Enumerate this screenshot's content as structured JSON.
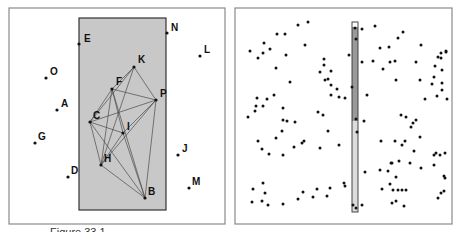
{
  "figure": {
    "caption": "Figure 33.1",
    "left_panel": {
      "frame": {
        "x": 9,
        "y": 8,
        "w": 216,
        "h": 216
      },
      "region": {
        "x": 79,
        "y": 18,
        "w": 87,
        "h": 192,
        "fill": "#c8c8c8"
      },
      "points": [
        {
          "label": "E",
          "x": 79,
          "y": 44,
          "lx": 84,
          "ly": 42
        },
        {
          "label": "N",
          "x": 167,
          "y": 33,
          "lx": 171,
          "ly": 31
        },
        {
          "label": "L",
          "x": 200,
          "y": 56,
          "lx": 204,
          "ly": 53
        },
        {
          "label": "K",
          "x": 134,
          "y": 67,
          "lx": 138,
          "ly": 63
        },
        {
          "label": "O",
          "x": 46,
          "y": 78,
          "lx": 50,
          "ly": 75
        },
        {
          "label": "F",
          "x": 112,
          "y": 89,
          "lx": 116,
          "ly": 85
        },
        {
          "label": "P",
          "x": 156,
          "y": 100,
          "lx": 160,
          "ly": 97
        },
        {
          "label": "A",
          "x": 57,
          "y": 110,
          "lx": 61,
          "ly": 107
        },
        {
          "label": "C",
          "x": 90,
          "y": 122,
          "lx": 93,
          "ly": 119
        },
        {
          "label": "I",
          "x": 123,
          "y": 133,
          "lx": 127,
          "ly": 130
        },
        {
          "label": "G",
          "x": 35,
          "y": 143,
          "lx": 38,
          "ly": 140
        },
        {
          "label": "J",
          "x": 178,
          "y": 155,
          "lx": 182,
          "ly": 152
        },
        {
          "label": "H",
          "x": 101,
          "y": 165,
          "lx": 104,
          "ly": 162
        },
        {
          "label": "D",
          "x": 68,
          "y": 177,
          "lx": 71,
          "ly": 174
        },
        {
          "label": "M",
          "x": 189,
          "y": 188,
          "lx": 192,
          "ly": 185
        },
        {
          "label": "B",
          "x": 145,
          "y": 198,
          "lx": 148,
          "ly": 195
        }
      ],
      "edges": [
        [
          "K",
          "F"
        ],
        [
          "K",
          "C"
        ],
        [
          "K",
          "P"
        ],
        [
          "K",
          "H"
        ],
        [
          "F",
          "P"
        ],
        [
          "F",
          "C"
        ],
        [
          "F",
          "I"
        ],
        [
          "F",
          "H"
        ],
        [
          "F",
          "B"
        ],
        [
          "C",
          "P"
        ],
        [
          "C",
          "I"
        ],
        [
          "C",
          "H"
        ],
        [
          "C",
          "B"
        ],
        [
          "P",
          "I"
        ],
        [
          "P",
          "H"
        ],
        [
          "P",
          "B"
        ],
        [
          "I",
          "H"
        ],
        [
          "I",
          "B"
        ],
        [
          "H",
          "B"
        ]
      ]
    },
    "right_panel": {
      "frame": {
        "x": 235,
        "y": 8,
        "w": 217,
        "h": 216
      },
      "bar": {
        "x": 352,
        "y": 22,
        "w": 6,
        "h": 190,
        "split_y": 121,
        "dark_fill": "#9a9a9a",
        "light_fill": "#dcdcdc"
      },
      "points": [
        [
          250,
          51
        ],
        [
          258,
          58
        ],
        [
          263,
          53
        ],
        [
          264,
          43
        ],
        [
          277,
          34
        ],
        [
          270,
          49
        ],
        [
          285,
          34
        ],
        [
          286,
          55
        ],
        [
          276,
          68
        ],
        [
          298,
          25
        ],
        [
          290,
          82
        ],
        [
          308,
          22
        ],
        [
          305,
          45
        ],
        [
          320,
          72
        ],
        [
          324,
          59
        ],
        [
          324,
          65
        ],
        [
          328,
          79
        ],
        [
          325,
          80
        ],
        [
          331,
          71
        ],
        [
          331,
          85
        ],
        [
          337,
          89
        ],
        [
          331,
          95
        ],
        [
          349,
          55
        ],
        [
          355,
          28
        ],
        [
          356,
          39
        ],
        [
          356,
          119
        ],
        [
          257,
          98
        ],
        [
          256,
          106
        ],
        [
          274,
          95
        ],
        [
          267,
          99
        ],
        [
          283,
          108
        ],
        [
          339,
          97
        ],
        [
          352,
          87
        ],
        [
          345,
          98
        ],
        [
          248,
          117
        ],
        [
          255,
          111
        ],
        [
          263,
          106
        ],
        [
          283,
          120
        ],
        [
          287,
          121
        ],
        [
          258,
          141
        ],
        [
          262,
          149
        ],
        [
          276,
          138
        ],
        [
          282,
          131
        ],
        [
          283,
          155
        ],
        [
          269,
          154
        ],
        [
          294,
          147
        ],
        [
          328,
          131
        ],
        [
          304,
          141
        ],
        [
          323,
          115
        ],
        [
          302,
          143
        ],
        [
          318,
          112
        ],
        [
          339,
          145
        ],
        [
          295,
          122
        ],
        [
          320,
          148
        ],
        [
          357,
          132
        ],
        [
          253,
          189
        ],
        [
          263,
          183
        ],
        [
          265,
          193
        ],
        [
          262,
          201
        ],
        [
          252,
          202
        ],
        [
          268,
          205
        ],
        [
          283,
          204
        ],
        [
          298,
          199
        ],
        [
          303,
          192
        ],
        [
          313,
          197
        ],
        [
          327,
          196
        ],
        [
          330,
          188
        ],
        [
          317,
          189
        ],
        [
          344,
          183
        ],
        [
          345,
          186
        ],
        [
          353,
          205
        ],
        [
          356,
          208
        ],
        [
          362,
          29
        ],
        [
          375,
          26
        ],
        [
          398,
          38
        ],
        [
          403,
          32
        ],
        [
          421,
          45
        ],
        [
          438,
          57
        ],
        [
          446,
          52
        ],
        [
          441,
          53
        ],
        [
          446,
          51
        ],
        [
          441,
          58
        ],
        [
          442,
          70
        ],
        [
          435,
          66
        ],
        [
          416,
          62
        ],
        [
          390,
          62
        ],
        [
          389,
          47
        ],
        [
          395,
          61
        ],
        [
          362,
          62
        ],
        [
          380,
          48
        ],
        [
          373,
          61
        ],
        [
          383,
          69
        ],
        [
          396,
          80
        ],
        [
          420,
          80
        ],
        [
          434,
          77
        ],
        [
          432,
          84
        ],
        [
          442,
          83
        ],
        [
          442,
          90
        ],
        [
          425,
          99
        ],
        [
          437,
          96
        ],
        [
          447,
          99
        ],
        [
          367,
          95
        ],
        [
          364,
          121
        ],
        [
          401,
          115
        ],
        [
          406,
          117
        ],
        [
          413,
          123
        ],
        [
          411,
          127
        ],
        [
          416,
          120
        ],
        [
          420,
          137
        ],
        [
          405,
          141
        ],
        [
          381,
          141
        ],
        [
          395,
          141
        ],
        [
          402,
          145
        ],
        [
          414,
          151
        ],
        [
          391,
          163
        ],
        [
          410,
          163
        ],
        [
          421,
          168
        ],
        [
          434,
          165
        ],
        [
          434,
          155
        ],
        [
          440,
          155
        ],
        [
          436,
          153
        ],
        [
          445,
          153
        ],
        [
          399,
          161
        ],
        [
          392,
          163
        ],
        [
          380,
          170
        ],
        [
          388,
          171
        ],
        [
          396,
          177
        ],
        [
          390,
          184
        ],
        [
          365,
          172
        ],
        [
          382,
          189
        ],
        [
          362,
          205
        ],
        [
          444,
          176
        ],
        [
          445,
          178
        ],
        [
          441,
          193
        ],
        [
          444,
          191
        ],
        [
          438,
          198
        ],
        [
          393,
          190
        ],
        [
          398,
          190
        ],
        [
          402,
          190
        ],
        [
          406,
          190
        ],
        [
          392,
          203
        ],
        [
          396,
          201
        ],
        [
          404,
          206
        ]
      ]
    }
  }
}
